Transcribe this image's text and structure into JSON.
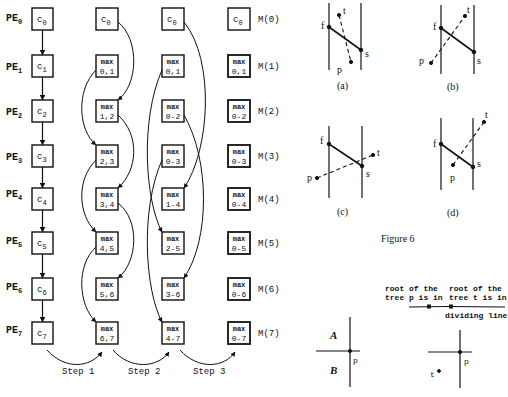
{
  "prefix_diagram": {
    "pe_labels": [
      "PE",
      "PE",
      "PE",
      "PE",
      "PE",
      "PE",
      "PE",
      "PE"
    ],
    "pe_subscripts": [
      "0",
      "1",
      "2",
      "3",
      "4",
      "5",
      "6",
      "7"
    ],
    "column0": [
      {
        "top": "c",
        "sub": "0"
      },
      {
        "top": "c",
        "sub": "1"
      },
      {
        "top": "c",
        "sub": "2"
      },
      {
        "top": "c",
        "sub": "3"
      },
      {
        "top": "c",
        "sub": "4"
      },
      {
        "top": "c",
        "sub": "5"
      },
      {
        "top": "c",
        "sub": "6"
      },
      {
        "top": "c",
        "sub": "7"
      }
    ],
    "column1": [
      {
        "top": "c",
        "sub": "0"
      },
      {
        "top": "max",
        "bottom": "0,1"
      },
      {
        "top": "max",
        "bottom": "1,2"
      },
      {
        "top": "max",
        "bottom": "2,3"
      },
      {
        "top": "max",
        "bottom": "3,4"
      },
      {
        "top": "max",
        "bottom": "4,5"
      },
      {
        "top": "max",
        "bottom": "5,6"
      },
      {
        "top": "max",
        "bottom": "6,7"
      }
    ],
    "column2": [
      {
        "top": "c",
        "sub": "0"
      },
      {
        "top": "max",
        "bottom": "0,1"
      },
      {
        "top": "max",
        "bottom": "0-2"
      },
      {
        "top": "max",
        "bottom": "0-3"
      },
      {
        "top": "max",
        "bottom": "1-4"
      },
      {
        "top": "max",
        "bottom": "2-5"
      },
      {
        "top": "max",
        "bottom": "3-6"
      },
      {
        "top": "max",
        "bottom": "4-7"
      }
    ],
    "column3": [
      {
        "top": "c",
        "sub": "0"
      },
      {
        "top": "max",
        "bottom": "0,1"
      },
      {
        "top": "max",
        "bottom": "0-2"
      },
      {
        "top": "max",
        "bottom": "0-3"
      },
      {
        "top": "max",
        "bottom": "0-4"
      },
      {
        "top": "max",
        "bottom": "0-5"
      },
      {
        "top": "max",
        "bottom": "0-6"
      },
      {
        "top": "max",
        "bottom": "0-7"
      }
    ],
    "m_labels": [
      "M(0)",
      "M(1)",
      "M(2)",
      "M(3)",
      "M(4)",
      "M(5)",
      "M(6)",
      "M(7)"
    ],
    "steps": [
      "Step 1",
      "Step 2",
      "Step 3"
    ]
  },
  "figure6": {
    "panels": [
      {
        "caption": "(a)",
        "labels": {
          "f": "f",
          "s": "s",
          "t": "t",
          "p": "p"
        }
      },
      {
        "caption": "(b)",
        "labels": {
          "f": "f",
          "s": "s",
          "t": "t",
          "p": "p"
        }
      },
      {
        "caption": "(c)",
        "labels": {
          "f": "f",
          "s": "s",
          "t": "t",
          "p": "p"
        }
      },
      {
        "caption": "(d)",
        "labels": {
          "f": "f",
          "s": "s",
          "t": "t",
          "p": "p"
        }
      }
    ],
    "title": "Figure 6"
  },
  "dividing_figure": {
    "root_p_line1": "root of the",
    "root_p_line2": "tree p is in",
    "root_t_line1": "root of the",
    "root_t_line2": "tree t is in",
    "dividing_line_label": "dividing line",
    "left_region_A": "A",
    "left_region_B": "B",
    "left_point": "p",
    "right_point_p": "p",
    "right_point_t": "t"
  }
}
